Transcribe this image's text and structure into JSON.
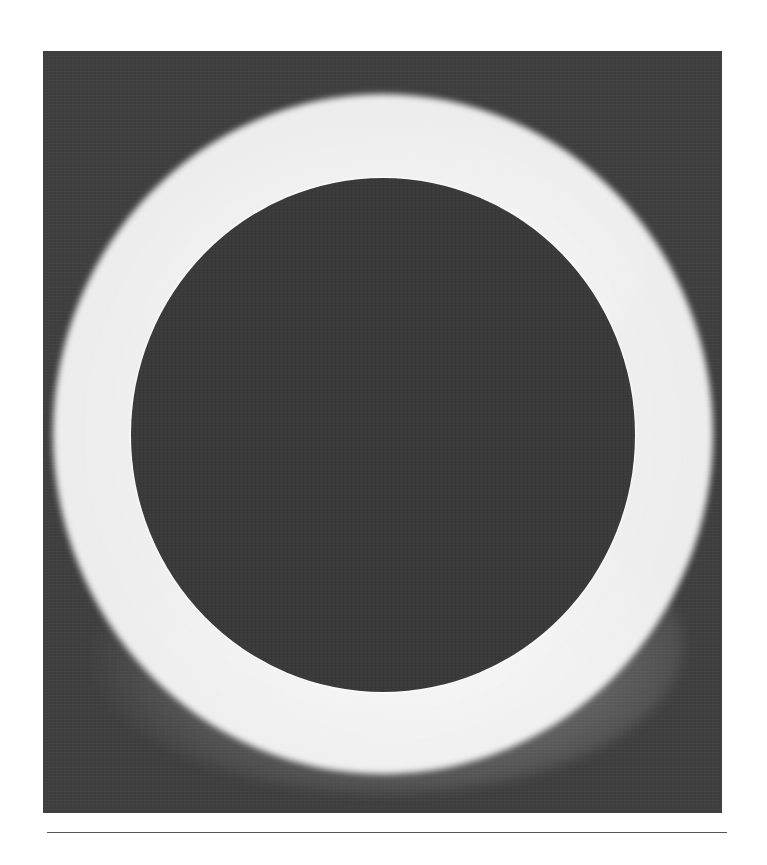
{
  "figure": {
    "colors": {
      "page_background": "#ffffff",
      "sky": "#3f3f3f",
      "moon_disk": "#3a3a3a",
      "corona": "#ffffff",
      "rule": "#555555"
    }
  },
  "caption": ""
}
